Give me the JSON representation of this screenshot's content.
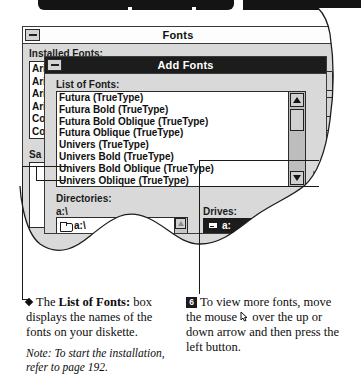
{
  "window_fonts": {
    "title": "Fonts",
    "minimize_icon": "minimize-icon",
    "installed_label": "Installed Fonts:",
    "installed_items": [
      "Ari",
      "Ari",
      "Ari",
      "Ari",
      "Co",
      "Co"
    ],
    "sample_label": "Sa",
    "side_buttons": [
      "",
      "",
      "S",
      ""
    ]
  },
  "window_add_fonts": {
    "title": "Add Fonts",
    "minimize_icon": "minimize-icon",
    "list_label": "List of Fonts:",
    "fonts": [
      "Futura (TrueType)",
      "Futura Bold (TrueType)",
      "Futura Bold Oblique (TrueType)",
      "Futura Oblique (TrueType)",
      "Univers (TrueType)",
      "Univers Bold (TrueType)",
      "Univers Bold Oblique (TrueType)",
      "Univers Oblique (TrueType)"
    ],
    "scroll_up_icon": "arrow-up-icon",
    "scroll_down_icon": "arrow-down-icon",
    "directories_label": "Directories:",
    "directories_path": "a:\\",
    "directory_items": [
      "a:\\"
    ],
    "drives_label": "Drives:",
    "drives_selected": "a:",
    "drive_icon": "floppy-drive-icon",
    "folder_icon": "folder-icon"
  },
  "callouts": {
    "left": {
      "bullet": "diamond-bullet",
      "line1_pre": "The ",
      "line1_bold": "List of Fonts:",
      "line1_post": " box displays the names of the fonts on your diskette.",
      "note": "Note: To start the installation, refer to page 192."
    },
    "right": {
      "step": "6",
      "text_pre": "To view more fonts, move the mouse ",
      "cursor_icon": "mouse-pointer-icon",
      "text_post": " over the up or down arrow and then press the left button."
    }
  },
  "decor": {
    "page_arrow_icon": "right-triangle-marker"
  }
}
